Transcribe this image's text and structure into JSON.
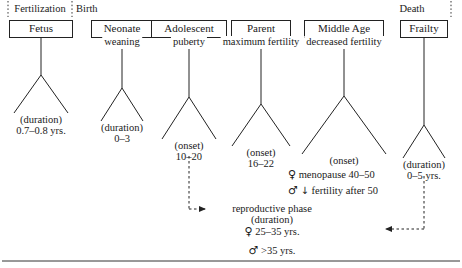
{
  "figure": {
    "eras": [
      {
        "id": "fertilization",
        "label": "Fertilization",
        "x": 40,
        "y": 3
      },
      {
        "id": "birth",
        "label": "Birth",
        "x": 76,
        "y": 3
      },
      {
        "id": "death",
        "label": "Death",
        "x": 412,
        "y": 3
      }
    ],
    "dividers": [
      {
        "id": "divider-fertilization-start",
        "x": 8
      },
      {
        "id": "divider-fertilization-end",
        "x": 72
      },
      {
        "id": "divider-death",
        "x": 451
      }
    ],
    "stages": [
      {
        "id": "fetus",
        "name": "Fetus",
        "sub": "",
        "cx": 41,
        "box_y": 20,
        "box_w": 64,
        "stem_top": 36,
        "stem_bottom": 75,
        "tri_apex_y": 75,
        "tri_base_y": 113,
        "tri_half_w": 27,
        "note": [
          "(duration)",
          "0.7–0.8 yrs."
        ],
        "note_y": 114
      },
      {
        "id": "neonate",
        "name": "Neonate",
        "sub": "weaning",
        "cx": 122,
        "box_y": 20,
        "box_w": 62,
        "stem_top": 49,
        "stem_bottom": 88,
        "tri_apex_y": 88,
        "tri_base_y": 121,
        "tri_half_w": 21,
        "note": [
          "(duration)",
          "0–3"
        ],
        "note_y": 122
      },
      {
        "id": "adolescent",
        "name": "Adolescent",
        "sub": "puberty",
        "cx": 189,
        "box_y": 20,
        "box_w": 76,
        "stem_top": 49,
        "stem_bottom": 97,
        "tri_apex_y": 97,
        "tri_base_y": 139,
        "tri_half_w": 27,
        "note": [
          "(onset)",
          "10–20"
        ],
        "note_y": 140
      },
      {
        "id": "parent",
        "name": "Parent",
        "sub": "maximum fertility",
        "cx": 261,
        "box_y": 20,
        "box_w": 60,
        "stem_top": 49,
        "stem_bottom": 104,
        "tri_apex_y": 104,
        "tri_base_y": 146,
        "tri_half_w": 29,
        "note": [
          "(onset)",
          "16–22"
        ],
        "note_y": 147
      },
      {
        "id": "middle-age",
        "name": "Middle Age",
        "sub": "decreased fertility",
        "cx": 344,
        "box_y": 20,
        "box_w": 80,
        "stem_top": 49,
        "stem_bottom": 96,
        "tri_apex_y": 96,
        "tri_base_y": 154,
        "tri_half_w": 42,
        "note": [
          "(onset)"
        ],
        "note_y": 155
      },
      {
        "id": "frailty",
        "name": "Frailty",
        "sub": "",
        "cx": 424,
        "box_y": 20,
        "box_w": 48,
        "stem_top": 36,
        "stem_bottom": 125,
        "tri_apex_y": 125,
        "tri_base_y": 158,
        "tri_half_w": 21,
        "note": [
          "(duration)",
          "0–5 yrs."
        ],
        "note_y": 159
      }
    ],
    "annotations": {
      "middle_age_female": {
        "symbol": "♀",
        "text": "menopause 40–50",
        "x": 288,
        "y": 168
      },
      "middle_age_male": {
        "symbol": "♂",
        "arrow": "↓",
        "text": "fertility after 50",
        "x": 288,
        "y": 184
      },
      "reproductive": {
        "heading": "reproductive phase",
        "subheading": "(duration)",
        "female_symbol": "♀",
        "female_value": "25–35 yrs.",
        "male_symbol": "♂",
        "male_value": ">35 yrs.",
        "cx": 272,
        "y": 203
      }
    },
    "connectors": [
      {
        "id": "adolescent-to-reproductive",
        "style": "dotted",
        "from_x": 189,
        "from_y": 156,
        "corner_y": 209,
        "to_x": 205,
        "arrow": "right"
      },
      {
        "id": "frailty-to-reproductive",
        "style": "dotted",
        "from_x": 424,
        "from_y": 176,
        "corner_y": 229,
        "to_x": 386,
        "arrow": "left"
      }
    ],
    "baseline_rule": {
      "y": 261
    },
    "colors": {
      "ink": "#1a1a1a",
      "stroke": "#222222",
      "background": "#ffffff"
    }
  }
}
